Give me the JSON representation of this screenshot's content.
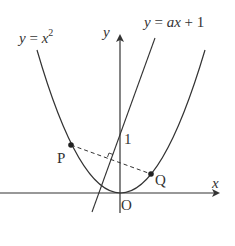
{
  "diagram": {
    "title": "",
    "labels": {
      "parabola_eq_y": "y",
      "parabola_eq_eq": " = ",
      "parabola_eq_x": "x",
      "parabola_eq_exp": "2",
      "line_eq_y": "y",
      "line_eq_rest": " = ",
      "line_eq_ax": "ax",
      "line_eq_plus": " + 1",
      "y_axis": "y",
      "x_axis": "x",
      "origin": "O",
      "intercept": "1",
      "point_p": "P",
      "point_q": "Q"
    },
    "elements": {
      "parabola": "y = x^2",
      "line": "y = ax + 1",
      "points": [
        "P",
        "Q"
      ],
      "segment": "PQ (dashed), perpendicular to line y = ax + 1",
      "right_angle_marker": true
    },
    "colors": {
      "stroke": "#333333",
      "background": "#ffffff"
    }
  }
}
